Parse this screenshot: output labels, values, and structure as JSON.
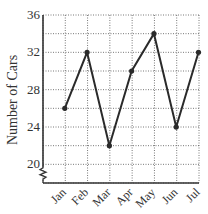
{
  "chart_data": {
    "type": "line",
    "title": "",
    "xlabel": "",
    "ylabel": "Number of Cars",
    "categories": [
      "Jan",
      "Feb",
      "Mar",
      "Apr",
      "May",
      "Jun",
      "Jul"
    ],
    "values": [
      26,
      32,
      22,
      30,
      34,
      24,
      32
    ],
    "y_ticks": [
      20,
      24,
      28,
      32,
      36
    ],
    "ylim": [
      18,
      36
    ],
    "y_axis_break": true,
    "grid": true,
    "grid_style": "dotted",
    "minor_grid_step": 2,
    "legend": null,
    "line_color": "#2a2a2a",
    "marker": "circle"
  }
}
